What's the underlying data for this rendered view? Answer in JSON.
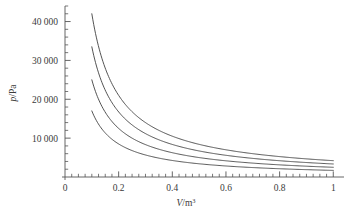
{
  "figure": {
    "background_color": "#ffffff",
    "line_color": "#4a4a4a",
    "text_color": "#3a3a3a",
    "axis_color": "#555555"
  },
  "axes": {
    "x_label_var": "V",
    "x_label_unit": "/m",
    "x_label_exp": "3",
    "y_label_var": "p",
    "y_label_unit": "/Pa",
    "x_ticks": [
      "0",
      "0.2",
      "0.4",
      "0.6",
      "0.8",
      "1"
    ],
    "y_ticks": [
      "10 000",
      "20 000",
      "30 000",
      "40 000"
    ]
  },
  "chart_data": {
    "type": "line",
    "title": "",
    "xlabel": "V/m^3",
    "ylabel": "p/Pa",
    "xlim": [
      0,
      1.04
    ],
    "ylim": [
      0,
      44000
    ],
    "grid": false,
    "legend": "none",
    "x_major_ticks": [
      0,
      0.2,
      0.4,
      0.6,
      0.8,
      1
    ],
    "x_minor_step": 0.025,
    "y_major_ticks": [
      10000,
      20000,
      30000,
      40000
    ],
    "y_minor_step": 2000,
    "x_domain_of_curves": [
      0.1,
      1.0
    ],
    "relation": "p = C / V (isotherms, constant C per curve)",
    "series": [
      {
        "name": "isotherm-1",
        "constant": 4200,
        "x": [
          0.1,
          0.125,
          0.15,
          0.175,
          0.2,
          0.25,
          0.3,
          0.35,
          0.4,
          0.45,
          0.5,
          0.55,
          0.6,
          0.65,
          0.7,
          0.75,
          0.8,
          0.85,
          0.9,
          0.95,
          1.0
        ],
        "values": [
          42000,
          33600,
          28000,
          24000,
          21000,
          16800,
          14000,
          12000,
          10500,
          9333,
          8400,
          7636,
          7000,
          6462,
          6000,
          5600,
          5250,
          4941,
          4667,
          4421,
          4200
        ]
      },
      {
        "name": "isotherm-2",
        "constant": 3350,
        "x": [
          0.1,
          0.125,
          0.15,
          0.175,
          0.2,
          0.25,
          0.3,
          0.35,
          0.4,
          0.45,
          0.5,
          0.55,
          0.6,
          0.65,
          0.7,
          0.75,
          0.8,
          0.85,
          0.9,
          0.95,
          1.0
        ],
        "values": [
          33500,
          26800,
          22333,
          19143,
          16750,
          13400,
          11167,
          9571,
          8375,
          7444,
          6700,
          6091,
          5583,
          5154,
          4786,
          4467,
          4188,
          3941,
          3722,
          3526,
          3350
        ]
      },
      {
        "name": "isotherm-3",
        "constant": 2500,
        "x": [
          0.1,
          0.125,
          0.15,
          0.175,
          0.2,
          0.25,
          0.3,
          0.35,
          0.4,
          0.45,
          0.5,
          0.55,
          0.6,
          0.65,
          0.7,
          0.75,
          0.8,
          0.85,
          0.9,
          0.95,
          1.0
        ],
        "values": [
          25000,
          20000,
          16667,
          14286,
          12500,
          10000,
          8333,
          7143,
          6250,
          5556,
          5000,
          4545,
          4167,
          3846,
          3571,
          3333,
          3125,
          2941,
          2778,
          2632,
          2500
        ]
      },
      {
        "name": "isotherm-4",
        "constant": 1700,
        "x": [
          0.1,
          0.125,
          0.15,
          0.175,
          0.2,
          0.25,
          0.3,
          0.35,
          0.4,
          0.45,
          0.5,
          0.55,
          0.6,
          0.65,
          0.7,
          0.75,
          0.8,
          0.85,
          0.9,
          0.95,
          1.0
        ],
        "values": [
          17000,
          13600,
          11333,
          9714,
          8500,
          6800,
          5667,
          4857,
          4250,
          3778,
          3400,
          3091,
          2833,
          2615,
          2429,
          2267,
          2125,
          2000,
          1889,
          1789,
          1700
        ]
      }
    ]
  }
}
